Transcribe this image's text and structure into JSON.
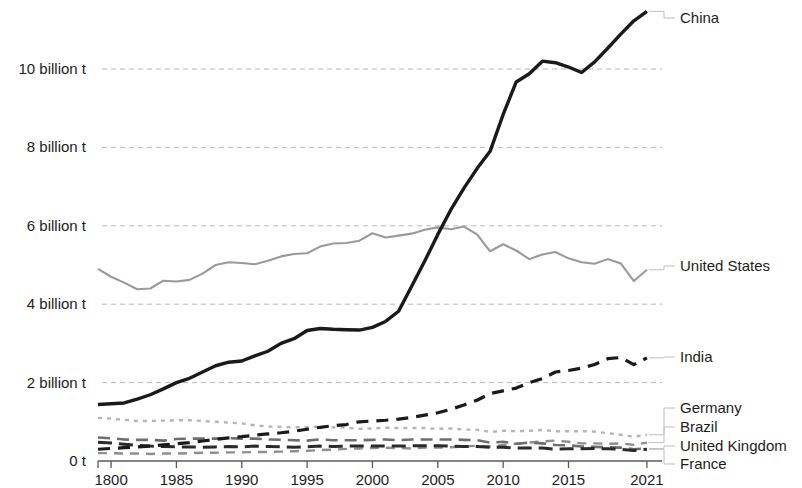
{
  "chart_data": {
    "type": "line",
    "title": "",
    "subtitle": "",
    "xlabel": "",
    "ylabel": "",
    "xlim": [
      1979,
      2022
    ],
    "ylim": [
      0,
      11.2
    ],
    "grid": true,
    "legend_position": "right-inline-labels",
    "y_ticks": [
      {
        "value": 0,
        "label": "0 t"
      },
      {
        "value": 2,
        "label": "2 billion t"
      },
      {
        "value": 4,
        "label": "4 billion t"
      },
      {
        "value": 6,
        "label": "6 billion t"
      },
      {
        "value": 8,
        "label": "8 billion t"
      },
      {
        "value": 10,
        "label": "10 billion t"
      }
    ],
    "x_ticks": [
      {
        "value": 1980,
        "label": "1800"
      },
      {
        "value": 1985,
        "label": "1985"
      },
      {
        "value": 1990,
        "label": "1990"
      },
      {
        "value": 1995,
        "label": "1995"
      },
      {
        "value": 2000,
        "label": "2000"
      },
      {
        "value": 2005,
        "label": "2005"
      },
      {
        "value": 2010,
        "label": "2010"
      },
      {
        "value": 2015,
        "label": "2015"
      },
      {
        "value": 2021,
        "label": "2021"
      }
    ],
    "x": [
      1979,
      1980,
      1981,
      1982,
      1983,
      1984,
      1985,
      1986,
      1987,
      1988,
      1989,
      1990,
      1991,
      1992,
      1993,
      1994,
      1995,
      1996,
      1997,
      1998,
      1999,
      2000,
      2001,
      2002,
      2003,
      2004,
      2005,
      2006,
      2007,
      2008,
      2009,
      2010,
      2011,
      2012,
      2013,
      2014,
      2015,
      2016,
      2017,
      2018,
      2019,
      2020,
      2021
    ],
    "series": [
      {
        "name": "China",
        "color": "#1a1a1a",
        "style": "solid",
        "width": 3.4,
        "values": [
          1.44,
          1.46,
          1.48,
          1.58,
          1.69,
          1.84,
          2.0,
          2.11,
          2.27,
          2.43,
          2.52,
          2.55,
          2.68,
          2.8,
          3.0,
          3.12,
          3.33,
          3.38,
          3.36,
          3.35,
          3.34,
          3.41,
          3.56,
          3.82,
          4.46,
          5.1,
          5.78,
          6.41,
          6.96,
          7.46,
          7.9,
          8.84,
          9.67,
          9.88,
          10.2,
          10.16,
          10.05,
          9.91,
          10.18,
          10.53,
          10.89,
          11.23,
          11.47
        ]
      },
      {
        "name": "United States",
        "color": "#9a9a9a",
        "style": "solid",
        "width": 2.1,
        "values": [
          4.9,
          4.7,
          4.55,
          4.38,
          4.4,
          4.6,
          4.58,
          4.62,
          4.78,
          5.0,
          5.07,
          5.05,
          5.02,
          5.11,
          5.22,
          5.28,
          5.3,
          5.47,
          5.55,
          5.56,
          5.62,
          5.81,
          5.7,
          5.75,
          5.8,
          5.9,
          5.96,
          5.91,
          5.98,
          5.78,
          5.35,
          5.53,
          5.37,
          5.15,
          5.27,
          5.33,
          5.17,
          5.07,
          5.03,
          5.15,
          5.04,
          4.59,
          4.88
        ]
      },
      {
        "name": "India",
        "color": "#1a1a1a",
        "style": "dashed-heavy",
        "width": 3.2,
        "values": [
          0.3,
          0.32,
          0.34,
          0.36,
          0.38,
          0.41,
          0.44,
          0.47,
          0.51,
          0.55,
          0.59,
          0.62,
          0.66,
          0.69,
          0.72,
          0.76,
          0.81,
          0.86,
          0.9,
          0.93,
          1.0,
          1.02,
          1.04,
          1.07,
          1.11,
          1.17,
          1.23,
          1.32,
          1.43,
          1.55,
          1.72,
          1.79,
          1.86,
          2.0,
          2.1,
          2.27,
          2.31,
          2.37,
          2.46,
          2.61,
          2.64,
          2.46,
          2.63
        ]
      },
      {
        "name": "Germany",
        "color": "#b5b5b5",
        "style": "dotted",
        "width": 2.4,
        "values": [
          1.1,
          1.08,
          1.05,
          1.02,
          1.02,
          1.03,
          1.04,
          1.04,
          1.02,
          1.0,
          0.98,
          0.96,
          0.91,
          0.88,
          0.87,
          0.86,
          0.86,
          0.88,
          0.86,
          0.85,
          0.82,
          0.83,
          0.85,
          0.84,
          0.84,
          0.84,
          0.82,
          0.83,
          0.8,
          0.8,
          0.74,
          0.77,
          0.76,
          0.77,
          0.79,
          0.76,
          0.76,
          0.76,
          0.75,
          0.71,
          0.67,
          0.62,
          0.67
        ]
      },
      {
        "name": "Brazil",
        "color": "#8e8e8e",
        "style": "dashed-light",
        "width": 2.4,
        "values": [
          0.2,
          0.2,
          0.19,
          0.19,
          0.18,
          0.19,
          0.19,
          0.2,
          0.21,
          0.21,
          0.22,
          0.22,
          0.23,
          0.23,
          0.24,
          0.25,
          0.26,
          0.28,
          0.29,
          0.31,
          0.32,
          0.33,
          0.34,
          0.33,
          0.32,
          0.34,
          0.34,
          0.35,
          0.37,
          0.39,
          0.37,
          0.41,
          0.44,
          0.47,
          0.5,
          0.52,
          0.49,
          0.45,
          0.45,
          0.44,
          0.45,
          0.41,
          0.47
        ]
      },
      {
        "name": "United Kingdom",
        "color": "#6e6e6e",
        "style": "dashed-mid",
        "width": 2.6,
        "values": [
          0.6,
          0.58,
          0.55,
          0.54,
          0.54,
          0.52,
          0.56,
          0.57,
          0.57,
          0.57,
          0.58,
          0.57,
          0.57,
          0.55,
          0.54,
          0.53,
          0.52,
          0.55,
          0.53,
          0.53,
          0.53,
          0.54,
          0.55,
          0.53,
          0.55,
          0.55,
          0.55,
          0.55,
          0.54,
          0.53,
          0.47,
          0.49,
          0.44,
          0.47,
          0.45,
          0.41,
          0.4,
          0.37,
          0.36,
          0.35,
          0.34,
          0.3,
          0.32
        ]
      },
      {
        "name": "France",
        "color": "#2a2a2a",
        "style": "dashed-heavy-low",
        "width": 3.0,
        "values": [
          0.48,
          0.46,
          0.43,
          0.4,
          0.38,
          0.37,
          0.36,
          0.36,
          0.35,
          0.36,
          0.37,
          0.36,
          0.38,
          0.37,
          0.36,
          0.35,
          0.36,
          0.38,
          0.37,
          0.38,
          0.38,
          0.38,
          0.38,
          0.38,
          0.39,
          0.39,
          0.39,
          0.38,
          0.37,
          0.37,
          0.35,
          0.35,
          0.33,
          0.33,
          0.33,
          0.3,
          0.31,
          0.31,
          0.32,
          0.31,
          0.3,
          0.27,
          0.3
        ]
      }
    ],
    "series_labels": [
      {
        "name": "China",
        "text": "China",
        "y_px": 18
      },
      {
        "name": "United States",
        "text": "United States",
        "y_px": 266
      },
      {
        "name": "India",
        "text": "India",
        "y_px": 357
      },
      {
        "name": "Germany",
        "text": "Germany",
        "y_px": 408
      },
      {
        "name": "Brazil",
        "text": "Brazil",
        "y_px": 427
      },
      {
        "name": "United Kingdom",
        "text": "United Kingdom",
        "y_px": 446
      },
      {
        "name": "France",
        "text": "France",
        "y_px": 464
      }
    ],
    "colors": {
      "gridline": "#b9b9b9",
      "axis": "#5a5a5a",
      "text": "#1d1d1d",
      "background": "#ffffff"
    }
  }
}
